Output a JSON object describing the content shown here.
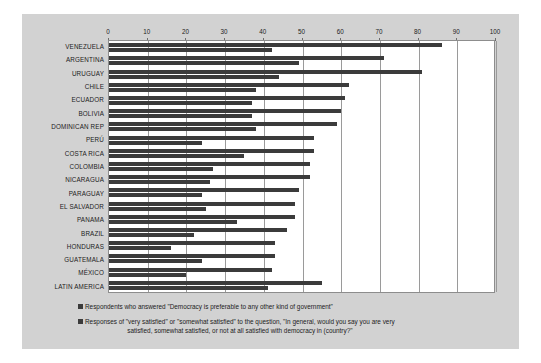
{
  "chart_data": {
    "type": "bar",
    "orientation": "horizontal",
    "title": "",
    "xlabel": "",
    "ylabel": "",
    "xlim": [
      0,
      100
    ],
    "xticks": [
      0,
      10,
      20,
      30,
      40,
      50,
      60,
      70,
      80,
      90,
      100
    ],
    "grid": true,
    "legend_position": "bottom",
    "categories": [
      "VENEZUELA",
      "ARGENTINA",
      "URUGUAY",
      "CHILE",
      "ECUADOR",
      "BOLIVIA",
      "DOMINICAN REP",
      "PERÚ",
      "COSTA RICA",
      "COLOMBIA",
      "NICARAGUA",
      "PARAGUAY",
      "EL SALVADOR",
      "PANAMA",
      "BRAZIL",
      "HONDURAS",
      "GUATEMALA",
      "MÉXICO",
      "LATIN AMERICA"
    ],
    "series": [
      {
        "name": "Respondents who answered \"Democracy is preferable to any other kind of government\"",
        "color": "#3b3b3b",
        "values": [
          86,
          71,
          81,
          62,
          61,
          60,
          59,
          53,
          53,
          52,
          52,
          49,
          48,
          48,
          46,
          43,
          43,
          42,
          55
        ]
      },
      {
        "name": "Responses of \"very satisfied\" or \"somewhat satisfied\" to the question, \"In general, would you say you are very satisfied, somewhat satisfied, or not at all satisfied with democracy in (country)?\"",
        "color": "#3b3b3b",
        "values": [
          42,
          49,
          44,
          38,
          37,
          37,
          38,
          24,
          35,
          27,
          26,
          24,
          25,
          33,
          22,
          16,
          24,
          20,
          41
        ]
      }
    ]
  },
  "legend": {
    "entry1": "Respondents who answered \"Democracy is preferable to any other kind of government\"",
    "entry2": "Responses of \"very satisfied\" or \"somewhat satisfied\" to the question, \"In general, would you say you are very\nsatisfied, somewhat satisfied, or not at all satisfied with democracy in (country?\""
  }
}
